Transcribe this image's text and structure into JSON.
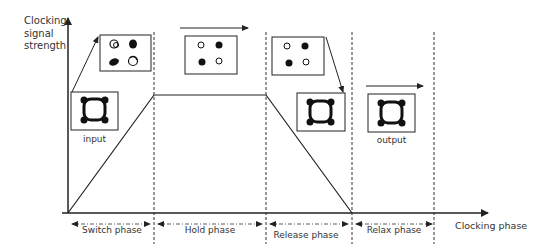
{
  "axes": {
    "y_label_lines": [
      "Clocking",
      "signal",
      "strength"
    ],
    "x_label": "Clocking phase"
  },
  "phases": [
    {
      "label": "Switch phase"
    },
    {
      "label": "Hold phase"
    },
    {
      "label": "Release phase"
    },
    {
      "label": "Relax phase"
    }
  ],
  "cells": {
    "input_label": "input",
    "output_label": "output"
  },
  "colors": {
    "line": "#222222",
    "text": "#333333",
    "dot_filled": "#111111"
  }
}
